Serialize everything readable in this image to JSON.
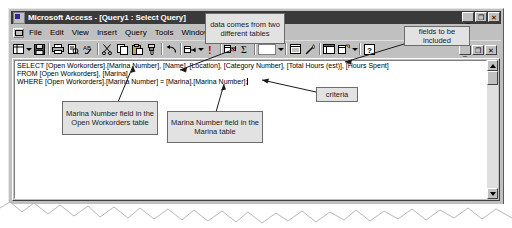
{
  "window": {
    "title": "Microsoft Access - [Query1 : Select Query]",
    "title_icon": "access-app-icon",
    "controls": [
      {
        "name": "minimize",
        "glyph": "_"
      },
      {
        "name": "restore",
        "glyph": "❐"
      },
      {
        "name": "close",
        "glyph": "✕"
      }
    ],
    "child_controls": [
      {
        "name": "minimize",
        "glyph": "_"
      },
      {
        "name": "restore",
        "glyph": "❐"
      },
      {
        "name": "close",
        "glyph": "✕"
      }
    ]
  },
  "menubar": {
    "system_icon": "mdi-system-menu-icon",
    "items": [
      {
        "label": "File",
        "accel": "F"
      },
      {
        "label": "Edit",
        "accel": "E"
      },
      {
        "label": "View",
        "accel": "V"
      },
      {
        "label": "Insert",
        "accel": "I"
      },
      {
        "label": "Query",
        "accel": "Q"
      },
      {
        "label": "Tools",
        "accel": "T"
      },
      {
        "label": "Window",
        "accel": "W"
      },
      {
        "label": "Help",
        "accel": "H"
      }
    ]
  },
  "toolbar": {
    "buttons": [
      {
        "name": "view-button",
        "icon": "datasheet-view-icon"
      },
      {
        "name": "view-dropdown",
        "icon": "chevron-down-icon"
      },
      {
        "name": "save-button",
        "icon": "floppy-disk-icon"
      },
      {
        "name": "print-button",
        "icon": "printer-icon"
      },
      {
        "name": "print-preview-button",
        "icon": "print-preview-icon"
      },
      {
        "name": "spelling-button",
        "icon": "spell-check-icon"
      },
      {
        "name": "cut-button",
        "icon": "scissors-icon"
      },
      {
        "name": "copy-button",
        "icon": "copy-icon"
      },
      {
        "name": "paste-button",
        "icon": "clipboard-paste-icon"
      },
      {
        "name": "format-painter-button",
        "icon": "paintbrush-icon"
      },
      {
        "name": "undo-button",
        "icon": "undo-arrow-icon"
      },
      {
        "name": "query-type-button",
        "icon": "query-type-icon"
      },
      {
        "name": "query-type-dropdown",
        "icon": "chevron-down-icon"
      },
      {
        "name": "run-button",
        "icon": "run-exclamation-icon"
      },
      {
        "name": "show-table-button",
        "icon": "show-table-icon"
      },
      {
        "name": "totals-button",
        "icon": "sigma-totals-icon"
      },
      {
        "name": "top-values-box",
        "icon": "top-values-icon"
      },
      {
        "name": "top-values-dropdown",
        "icon": "chevron-down-icon"
      },
      {
        "name": "properties-button",
        "icon": "properties-icon"
      },
      {
        "name": "build-button",
        "icon": "build-wand-icon"
      },
      {
        "name": "database-window-button",
        "icon": "database-window-icon"
      },
      {
        "name": "new-object-button",
        "icon": "new-object-icon"
      },
      {
        "name": "new-object-dropdown",
        "icon": "chevron-down-icon"
      },
      {
        "name": "help-button",
        "icon": "help-question-icon"
      }
    ]
  },
  "sql": {
    "lines": [
      "SELECT [Open Workorders].[Marina Number], [Name], [Location], [Category Number], [Total Hours (est)], [Hours Spent]",
      "FROM [Open Workorders], [Marina]",
      "WHERE [Open Workorders].[Marina Number] = [Marina].[Marina Number];"
    ]
  },
  "scrollbar": {
    "up_arrow": "scroll-up-icon",
    "down_arrow": "scroll-down-icon",
    "thumb": "scroll-thumb"
  },
  "annotations": [
    {
      "id": "a1",
      "text": "data comes from two different tables"
    },
    {
      "id": "a2",
      "text": "fields to be included"
    },
    {
      "id": "a3",
      "text": "Marina Number field in the Open Workorders table"
    },
    {
      "id": "a4",
      "text": "Marina Number field in the Marina table"
    },
    {
      "id": "a5",
      "text": "criteria"
    }
  ],
  "colors": {
    "window_face": "#c0c0c0",
    "titlebar": "#3a3a3a",
    "callout_fill": "#e2e2e2",
    "callout_border": "#6b6b6b",
    "page_background": "#ffffff"
  }
}
